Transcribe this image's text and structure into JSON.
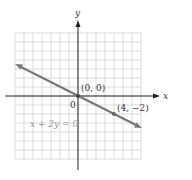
{
  "chart_data": {
    "type": "line",
    "title": "",
    "equation": "x + 2y = 0",
    "xlabel": "x",
    "ylabel": "y",
    "xlim": [
      -7,
      7
    ],
    "ylim": [
      -7,
      7
    ],
    "grid": true,
    "series": [
      {
        "name": "x + 2y = 0",
        "x": [
          -7,
          7
        ],
        "y": [
          3.5,
          -3.5
        ],
        "color": "#777777"
      }
    ],
    "points": [
      {
        "label": "(0, 0)",
        "x": 0,
        "y": 0
      },
      {
        "label": "(4, −2)",
        "x": 4,
        "y": -2
      }
    ],
    "origin_label": "0"
  }
}
